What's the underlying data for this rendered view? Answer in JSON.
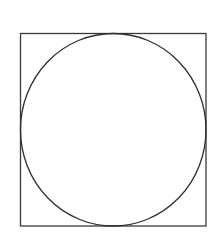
{
  "diagram": {
    "title": "",
    "shapes": [
      {
        "type": "square",
        "x": 20.5,
        "y": 33.5,
        "width": 185.5,
        "height": 192.5,
        "stroke": "#3a3a3a",
        "stroke_width": 1.3
      },
      {
        "type": "circle",
        "cx": 113.25,
        "cy": 129.75,
        "rx": 92.75,
        "ry": 96.25,
        "stroke": "#2e2e2e",
        "stroke_width": 1.3
      }
    ],
    "background": "#ffffff"
  }
}
